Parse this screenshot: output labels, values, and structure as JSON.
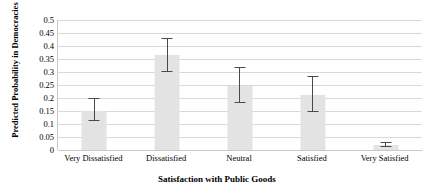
{
  "chart_data": {
    "type": "bar",
    "title": "",
    "xlabel": "Satisfaction with Public Goods",
    "ylabel": "Predicted Probability in Democracies",
    "categories": [
      "Very Dissatisfied",
      "Dissatisfied",
      "Neutral",
      "Satisfied",
      "Very Satisfied"
    ],
    "values": [
      0.15,
      0.365,
      0.245,
      0.21,
      0.02
    ],
    "error_low": [
      0.11,
      0.3,
      0.18,
      0.145,
      0.012
    ],
    "error_high": [
      0.2,
      0.43,
      0.32,
      0.285,
      0.032
    ],
    "ylim": [
      0,
      0.5
    ],
    "ytick_values": [
      0,
      0.05,
      0.1,
      0.15,
      0.2,
      0.25,
      0.3,
      0.35,
      0.4,
      0.45,
      0.5
    ],
    "ytick_labels": [
      "0",
      "0.05",
      "0.1",
      "0.15",
      "0.2",
      "0.25",
      "0.3",
      "0.35",
      "0.4",
      "0.45",
      "0.5"
    ],
    "grid": true,
    "legend": false,
    "bar_color": "#e3e3e3",
    "error_color": "#4a4a4a",
    "grid_color": "#d9d9d9",
    "axis_color": "#c8c8c8"
  }
}
